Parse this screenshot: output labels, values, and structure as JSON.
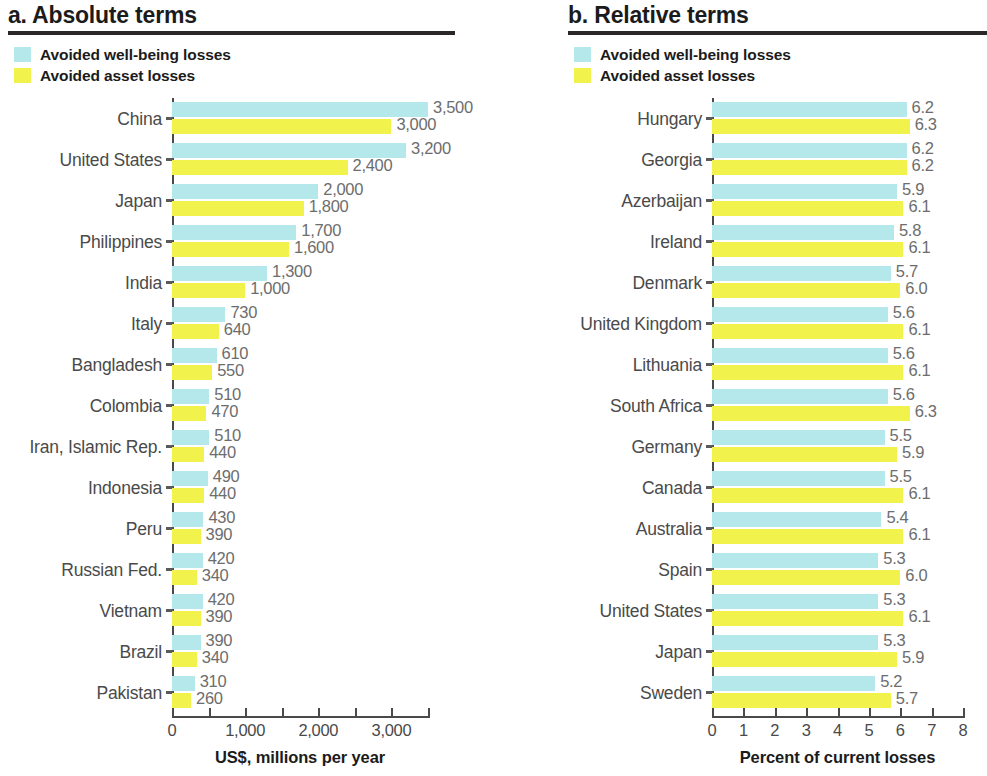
{
  "colors": {
    "wellbeing": "#b4e8ea",
    "asset": "#f2f24d",
    "axis": "#4a4a4a",
    "label": "#4a4a4a",
    "value": "#6d6d6d",
    "title": "#1b1b1b",
    "rule": "#2b2627"
  },
  "legend": {
    "wellbeing_label": "Avoided well-being losses",
    "asset_label": "Avoided asset losses"
  },
  "panels": {
    "a": {
      "title": "a. Absolute terms"
    },
    "b": {
      "title": "b. Relative terms"
    }
  },
  "chart_data": [
    {
      "type": "bar",
      "title": "a. Absolute terms",
      "orientation": "horizontal",
      "grouped": true,
      "xlabel": "US$, millions per year",
      "ylabel": "",
      "xlim": [
        0,
        3500
      ],
      "xticks": [
        0,
        1000,
        2000,
        3000
      ],
      "xtick_labels": [
        "0",
        "1,000",
        "2,000",
        "3,000"
      ],
      "xminor_ticks": [
        500,
        1500,
        2500,
        3500
      ],
      "grid": false,
      "legend_position": "top-left",
      "categories": [
        "China",
        "United States",
        "Japan",
        "Philippines",
        "India",
        "Italy",
        "Bangladesh",
        "Colombia",
        "Iran, Islamic Rep.",
        "Indonesia",
        "Peru",
        "Russian Fed.",
        "Vietnam",
        "Brazil",
        "Pakistan"
      ],
      "series": [
        {
          "name": "Avoided well-being losses",
          "color": "#b4e8ea",
          "values": [
            3500,
            3200,
            2000,
            1700,
            1300,
            730,
            610,
            510,
            510,
            490,
            430,
            420,
            420,
            390,
            310
          ],
          "labels": [
            "3,500",
            "3,200",
            "2,000",
            "1,700",
            "1,300",
            "730",
            "610",
            "510",
            "510",
            "490",
            "430",
            "420",
            "420",
            "390",
            "310"
          ]
        },
        {
          "name": "Avoided asset losses",
          "color": "#f2f24d",
          "values": [
            3000,
            2400,
            1800,
            1600,
            1000,
            640,
            550,
            470,
            440,
            440,
            390,
            340,
            390,
            340,
            260
          ],
          "labels": [
            "3,000",
            "2,400",
            "1,800",
            "1,600",
            "1,000",
            "640",
            "550",
            "470",
            "440",
            "440",
            "390",
            "340",
            "390",
            "340",
            "260"
          ]
        }
      ]
    },
    {
      "type": "bar",
      "title": "b. Relative terms",
      "orientation": "horizontal",
      "grouped": true,
      "xlabel": "Percent of current losses",
      "ylabel": "",
      "xlim": [
        0,
        8
      ],
      "xticks": [
        0,
        1,
        2,
        3,
        4,
        5,
        6,
        7,
        8
      ],
      "xtick_labels": [
        "0",
        "1",
        "2",
        "3",
        "4",
        "5",
        "6",
        "7",
        "8"
      ],
      "grid": false,
      "legend_position": "top-left",
      "categories": [
        "Hungary",
        "Georgia",
        "Azerbaijan",
        "Ireland",
        "Denmark",
        "United Kingdom",
        "Lithuania",
        "South Africa",
        "Germany",
        "Canada",
        "Australia",
        "Spain",
        "United States",
        "Japan",
        "Sweden"
      ],
      "series": [
        {
          "name": "Avoided well-being losses",
          "color": "#b4e8ea",
          "values": [
            6.2,
            6.2,
            5.9,
            5.8,
            5.7,
            5.6,
            5.6,
            5.6,
            5.5,
            5.5,
            5.4,
            5.3,
            5.3,
            5.3,
            5.2
          ],
          "labels": [
            "6.2",
            "6.2",
            "5.9",
            "5.8",
            "5.7",
            "5.6",
            "5.6",
            "5.6",
            "5.5",
            "5.5",
            "5.4",
            "5.3",
            "5.3",
            "5.3",
            "5.2"
          ]
        },
        {
          "name": "Avoided asset losses",
          "color": "#f2f24d",
          "values": [
            6.3,
            6.2,
            6.1,
            6.1,
            6.0,
            6.1,
            6.1,
            6.3,
            5.9,
            6.1,
            6.1,
            6.0,
            6.1,
            5.9,
            5.7
          ],
          "labels": [
            "6.3",
            "6.2",
            "6.1",
            "6.1",
            "6.0",
            "6.1",
            "6.1",
            "6.3",
            "5.9",
            "6.1",
            "6.1",
            "6.0",
            "6.1",
            "5.9",
            "5.7"
          ]
        }
      ]
    }
  ]
}
